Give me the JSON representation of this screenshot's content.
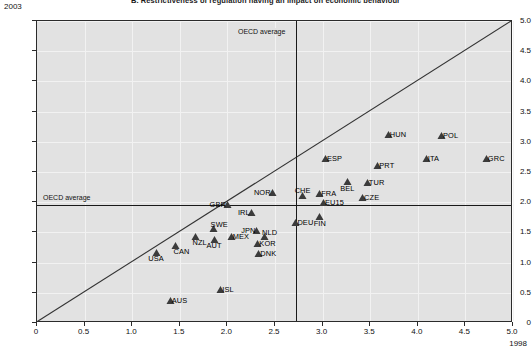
{
  "chart_data": {
    "type": "scatter",
    "title": "B. Restrictiveness of regulation having an impact on economic behaviour",
    "xlabel": "1998",
    "ylabel": "2003",
    "xlim": [
      0,
      5
    ],
    "ylim": [
      0,
      5
    ],
    "xticks": [
      "0",
      "0.5",
      "1.0",
      "1.5",
      "2.0",
      "2.5",
      "3.0",
      "3.5",
      "4.0",
      "4.5",
      "5.0"
    ],
    "yticks": [
      "0",
      "0.5",
      "1.0",
      "1.5",
      "2.0",
      "2.5",
      "3.0",
      "3.5",
      "4.0",
      "4.5",
      "5.0"
    ],
    "grid": true,
    "legend": "none",
    "annotations": {
      "oecd_average_vertical_label": "OECD average",
      "oecd_average_horizontal_label": "OECD average",
      "oecd_average_x": 2.72,
      "oecd_average_y": 1.95,
      "diagonal_line": "y = x"
    },
    "marker": "triangle",
    "marker_color": "#3b3b3b",
    "points": [
      {
        "label": "AUS",
        "x": 1.4,
        "y": 0.37,
        "lpos": "right"
      },
      {
        "label": "ISL",
        "x": 1.93,
        "y": 0.56,
        "lpos": "right"
      },
      {
        "label": "USA",
        "x": 1.25,
        "y": 1.17,
        "lpos": "bottom"
      },
      {
        "label": "CAN",
        "x": 1.46,
        "y": 1.28,
        "lpos": "botright"
      },
      {
        "label": "AUT",
        "x": 1.86,
        "y": 1.39,
        "lpos": "bottom"
      },
      {
        "label": "NZL",
        "x": 1.66,
        "y": 1.43,
        "lpos": "botright"
      },
      {
        "label": "SWE",
        "x": 1.85,
        "y": 1.56,
        "lpos": "topright"
      },
      {
        "label": "MEX",
        "x": 2.04,
        "y": 1.44,
        "lpos": "right"
      },
      {
        "label": "DNK",
        "x": 2.33,
        "y": 1.15,
        "lpos": "right"
      },
      {
        "label": "KOR",
        "x": 2.32,
        "y": 1.31,
        "lpos": "right"
      },
      {
        "label": "NLD",
        "x": 2.39,
        "y": 1.43,
        "lpos": "topright"
      },
      {
        "label": "JPN",
        "x": 2.31,
        "y": 1.53,
        "lpos": "left"
      },
      {
        "label": "IRL",
        "x": 2.25,
        "y": 1.83,
        "lpos": "left"
      },
      {
        "label": "GBR",
        "x": 2.0,
        "y": 1.96,
        "lpos": "left"
      },
      {
        "label": "DEU",
        "x": 2.72,
        "y": 1.67,
        "lpos": "right"
      },
      {
        "label": "FIN",
        "x": 2.97,
        "y": 1.76,
        "lpos": "bottom"
      },
      {
        "label": "NOR",
        "x": 2.47,
        "y": 2.16,
        "lpos": "left"
      },
      {
        "label": "CHE",
        "x": 2.79,
        "y": 2.11,
        "lpos": "top"
      },
      {
        "label": "FRA",
        "x": 2.97,
        "y": 2.14,
        "lpos": "right"
      },
      {
        "label": "EU15",
        "x": 3.01,
        "y": 1.99,
        "lpos": "right"
      },
      {
        "label": "CZE",
        "x": 3.42,
        "y": 2.08,
        "lpos": "right"
      },
      {
        "label": "BEL",
        "x": 3.26,
        "y": 2.34,
        "lpos": "bottom"
      },
      {
        "label": "TUR",
        "x": 3.47,
        "y": 2.33,
        "lpos": "right"
      },
      {
        "label": "PRT",
        "x": 3.58,
        "y": 2.61,
        "lpos": "right"
      },
      {
        "label": "ESP",
        "x": 3.03,
        "y": 2.72,
        "lpos": "right"
      },
      {
        "label": "ITA",
        "x": 4.09,
        "y": 2.72,
        "lpos": "right"
      },
      {
        "label": "GRC",
        "x": 4.72,
        "y": 2.72,
        "lpos": "right"
      },
      {
        "label": "POL",
        "x": 4.25,
        "y": 3.1,
        "lpos": "right"
      },
      {
        "label": "HUN",
        "x": 3.69,
        "y": 3.12,
        "lpos": "right"
      }
    ]
  }
}
